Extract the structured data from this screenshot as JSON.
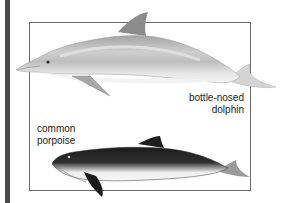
{
  "figure": {
    "species": [
      {
        "id": "dolphin",
        "label_lines": [
          "bottle-nosed",
          "dolphin"
        ],
        "colors": {
          "body": "#c9c9c9",
          "back": "#9a9a9a",
          "belly": "#eeeeee",
          "fin": "#8a8a8a"
        }
      },
      {
        "id": "porpoise",
        "label_lines": [
          "common",
          "porpoise"
        ],
        "colors": {
          "body": "#2a2a2a",
          "belly": "#f2f2f2",
          "fin": "#1e1e1e"
        }
      }
    ],
    "colors": {
      "frame": "#6a6a6a",
      "side_bar": "#4a4a4a",
      "background": "#ffffff"
    }
  }
}
